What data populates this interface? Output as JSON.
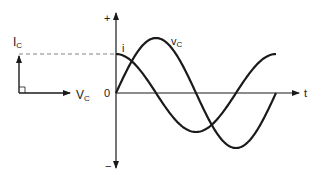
{
  "figure": {
    "phasor": {
      "current_label": "I",
      "current_sub": "C",
      "voltage_label": "V",
      "voltage_sub": "C"
    },
    "waveform": {
      "axis_plus": "+",
      "axis_minus": "−",
      "origin_label": "0",
      "time_label": "t",
      "current_curve_label": "i",
      "voltage_curve_label": "v",
      "voltage_curve_sub": "C"
    },
    "colors": {
      "stroke": "#1a1a1a",
      "dashed": "#777777"
    }
  }
}
